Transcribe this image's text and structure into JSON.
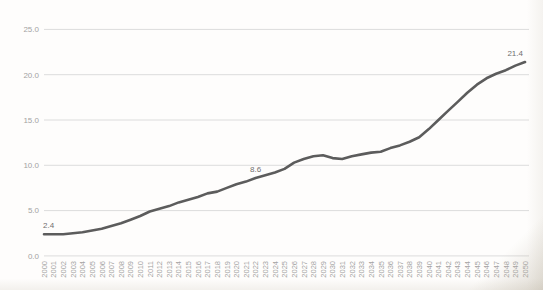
{
  "chart_data": {
    "type": "line",
    "title": "",
    "xlabel": "",
    "ylabel": "",
    "x": [
      2000,
      2001,
      2002,
      2003,
      2004,
      2005,
      2006,
      2007,
      2008,
      2009,
      2010,
      2011,
      2012,
      2013,
      2014,
      2015,
      2016,
      2017,
      2018,
      2019,
      2020,
      2021,
      2022,
      2023,
      2024,
      2025,
      2026,
      2027,
      2028,
      2029,
      2030,
      2031,
      2032,
      2033,
      2034,
      2035,
      2036,
      2037,
      2038,
      2039,
      2040,
      2041,
      2042,
      2043,
      2044,
      2045,
      2046,
      2047,
      2048,
      2049,
      2050
    ],
    "values": [
      2.4,
      2.4,
      2.4,
      2.5,
      2.6,
      2.8,
      3.0,
      3.3,
      3.6,
      4.0,
      4.4,
      4.9,
      5.2,
      5.5,
      5.9,
      6.2,
      6.5,
      6.9,
      7.1,
      7.5,
      7.9,
      8.2,
      8.6,
      8.9,
      9.2,
      9.6,
      10.3,
      10.7,
      11.0,
      11.1,
      10.8,
      10.7,
      11.0,
      11.2,
      11.4,
      11.5,
      11.9,
      12.2,
      12.6,
      13.1,
      14.0,
      15.0,
      16.0,
      17.0,
      18.0,
      18.9,
      19.6,
      20.1,
      20.5,
      21.0,
      21.4
    ],
    "ylim": [
      0,
      25
    ],
    "ytick_step": 5,
    "ytick_labels": [
      "0.0",
      "5.0",
      "10.0",
      "15.0",
      "20.0",
      "25.0"
    ],
    "grid": "horizontal-only",
    "legend": "none",
    "labeled_points": [
      {
        "x": 2000,
        "value": 2.4,
        "label": "2.4",
        "anchor": "start"
      },
      {
        "x": 2022,
        "value": 8.6,
        "label": "8.6",
        "anchor": "middle"
      },
      {
        "x": 2050,
        "value": 21.4,
        "label": "21.4",
        "anchor": "end"
      }
    ],
    "colors": {
      "series_line": "#5c5c5c",
      "gridline": "#dcdcdc",
      "axis_tick_label": "#a3a3a3",
      "data_point_label": "#6f6f6f",
      "background": "#fefdfc"
    }
  }
}
